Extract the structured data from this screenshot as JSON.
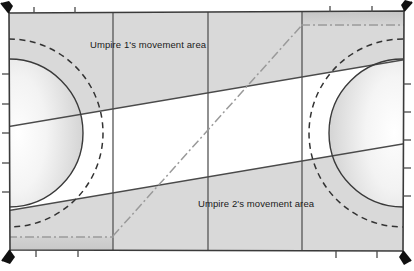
{
  "diagram": {
    "type": "field-hockey-pitch-umpire-zones",
    "labels": {
      "umpire1": "Umpire 1's movement area",
      "umpire2": "Umpire 2's movement area"
    },
    "colors": {
      "pitch_fill": "#d9d9d9",
      "pitch_fill_dark": "#c2c2c2",
      "unshaded_fill": "#ffffff",
      "line": "#3a3a3a",
      "line_dark": "#222222",
      "text": "#1a1a1a",
      "dashdot": "#8a8a8a",
      "corner_flag": "#111111"
    },
    "field": {
      "outline": {
        "x": 8,
        "y": 10,
        "width": 396,
        "height": 242
      },
      "vertical_lines_x": [
        113,
        208,
        302
      ],
      "corner_flags": 4,
      "sideline_ticks_top": [
        34,
        75,
        116,
        330,
        372
      ],
      "sideline_ticks_bottom": [
        36,
        78,
        336,
        377
      ]
    },
    "shooting_circles": {
      "left": {
        "center_x": 9,
        "center_y": 133,
        "solid_radius": 74,
        "dashed_radius": 94
      },
      "right": {
        "center_x": 403,
        "center_y": 133,
        "solid_radius": 74,
        "dashed_radius": 94
      }
    },
    "umpire1_zone": {
      "description": "upper shaded band from top edge down to diagonal boundary",
      "boundary_left_y": 128,
      "boundary_right_y": 58
    },
    "umpire2_zone": {
      "description": "lower shaded band from diagonal boundary down to bottom edge",
      "boundary_left_y": 212,
      "boundary_right_y": 142
    },
    "diagonal_centerline": {
      "style": "dash-dot",
      "from": {
        "x": 113,
        "y": 236
      },
      "to": {
        "x": 302,
        "y": 25
      }
    },
    "dashdot_horizontals": [
      {
        "from": {
          "x": 8,
          "y": 237
        },
        "to": {
          "x": 113,
          "y": 237
        }
      },
      {
        "from": {
          "x": 302,
          "y": 25
        },
        "to": {
          "x": 404,
          "y": 25
        }
      }
    ]
  }
}
